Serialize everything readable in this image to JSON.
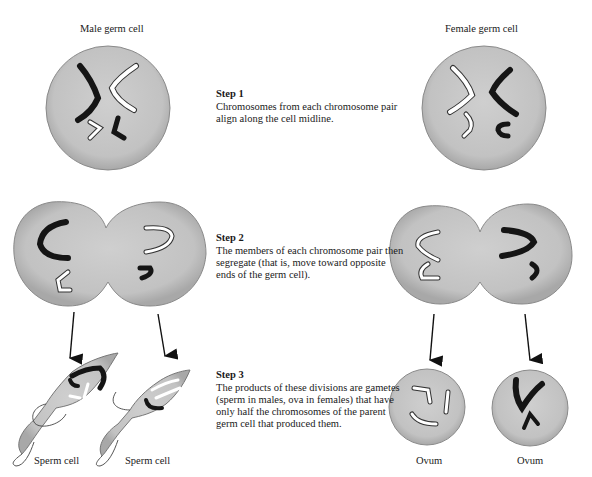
{
  "columns": {
    "male": {
      "title": "Male germ cell"
    },
    "female": {
      "title": "Female germ cell"
    }
  },
  "steps": [
    {
      "title": "Step 1",
      "text": "Chromosomes from each chromosome pair align along the cell midline."
    },
    {
      "title": "Step 2",
      "text": "The members of each chromosome pair then segregate (that is, move toward opposite ends of the germ cell)."
    },
    {
      "title": "Step 3",
      "text": "The products of these divisions are gametes (sperm in males, ova in females) that have only half the chromosomes of the parent germ cell that produced them."
    }
  ],
  "gametes": {
    "male": [
      "Sperm cell",
      "Sperm cell"
    ],
    "female": [
      "Ovum",
      "Ovum"
    ]
  },
  "colors": {
    "cell_fill": "#c4c4c4",
    "cell_edge": "#8a8a8a",
    "chromosome_dark": "#151515",
    "chromosome_light": "#ffffff",
    "arrow": "#111111"
  }
}
